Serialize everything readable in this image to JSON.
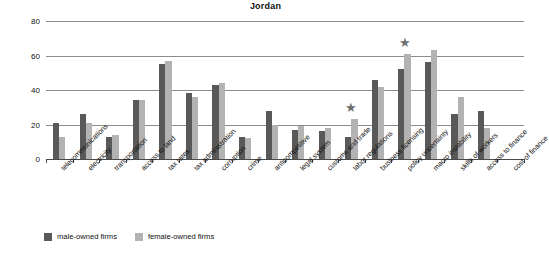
{
  "chart_data": {
    "type": "bar",
    "title": "Jordan",
    "xlabel": "",
    "ylabel": "% of firms",
    "ylim": [
      0,
      80
    ],
    "yticks": [
      0,
      20,
      40,
      60,
      80
    ],
    "grid": true,
    "legend_position": "bottom-left",
    "categories": [
      "telecommunications",
      "electricity",
      "transportation",
      "access to land",
      "tax rates",
      "tax administration",
      "corruption",
      "crime",
      "anticompetitive",
      "legal system",
      "customs and trade",
      "labor regulations",
      "business licensing",
      "policy uncertainty",
      "macro instability",
      "skills of workers",
      "access to finance",
      "cost of finance"
    ],
    "series": [
      {
        "name": "male-owned firms",
        "color": "#595959",
        "values": [
          21,
          26,
          13,
          34,
          55,
          38,
          43,
          13,
          28,
          17,
          16,
          13,
          46,
          52,
          56,
          26,
          28,
          0
        ]
      },
      {
        "name": "female-owned firms",
        "color": "#b3b3b3",
        "values": [
          13,
          21,
          14,
          34,
          57,
          36,
          44,
          12,
          20,
          19,
          18,
          23,
          42,
          61,
          63,
          36,
          18,
          0
        ]
      }
    ],
    "annotations": [
      {
        "marker": "star",
        "category": "labor regulations",
        "value": 30,
        "color": "#6f6f6f"
      },
      {
        "marker": "star",
        "category": "policy uncertainty",
        "value": 68,
        "color": "#6f6f6f"
      }
    ]
  },
  "legend": {
    "items": [
      {
        "label": "male-owned firms",
        "color": "#595959"
      },
      {
        "label": "female-owned firms",
        "color": "#b3b3b3"
      }
    ]
  }
}
